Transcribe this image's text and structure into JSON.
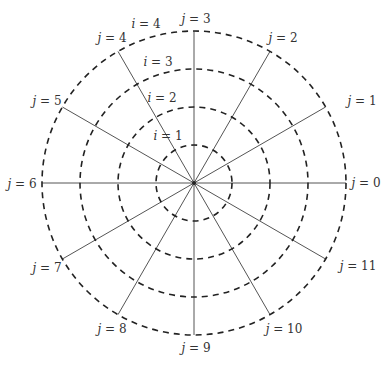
{
  "diagram": {
    "type": "polar-grid",
    "center": [
      194,
      183
    ],
    "rings": [
      {
        "index": 1,
        "label": "i = 1",
        "var": "i",
        "value": "1",
        "radius": 38
      },
      {
        "index": 2,
        "label": "i = 2",
        "var": "i",
        "value": "2",
        "radius": 76
      },
      {
        "index": 3,
        "label": "i = 3",
        "var": "i",
        "value": "3",
        "radius": 114
      },
      {
        "index": 4,
        "label": "i = 4",
        "var": "i",
        "value": "4",
        "radius": 152
      }
    ],
    "spokes": [
      {
        "index": 0,
        "var": "j",
        "value": "0",
        "angle_deg": 0
      },
      {
        "index": 1,
        "var": "j",
        "value": "1",
        "angle_deg": 30
      },
      {
        "index": 2,
        "var": "j",
        "value": "2",
        "angle_deg": 60
      },
      {
        "index": 3,
        "var": "j",
        "value": "3",
        "angle_deg": 90
      },
      {
        "index": 4,
        "var": "j",
        "value": "4",
        "angle_deg": 120
      },
      {
        "index": 5,
        "var": "j",
        "value": "5",
        "angle_deg": 150
      },
      {
        "index": 6,
        "var": "j",
        "value": "6",
        "angle_deg": 180
      },
      {
        "index": 7,
        "var": "j",
        "value": "7",
        "angle_deg": 210
      },
      {
        "index": 8,
        "var": "j",
        "value": "8",
        "angle_deg": 240
      },
      {
        "index": 9,
        "var": "j",
        "value": "9",
        "angle_deg": 270
      },
      {
        "index": 10,
        "var": "j",
        "value": "10",
        "angle_deg": 300
      },
      {
        "index": 11,
        "var": "j",
        "value": "11",
        "angle_deg": 330
      }
    ],
    "equals": " = "
  }
}
